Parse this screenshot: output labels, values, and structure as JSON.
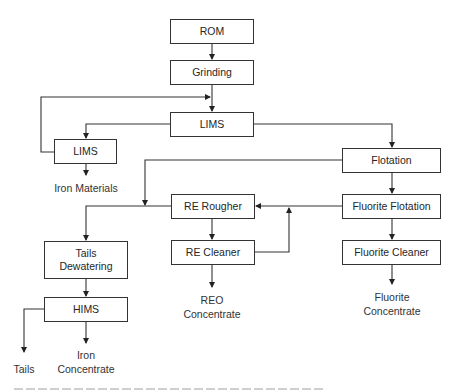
{
  "diagram": {
    "type": "process-flowsheet",
    "nodes": {
      "rom": "ROM",
      "grinding": "Grinding",
      "lims_main": "LIMS",
      "lims_secondary": "LIMS",
      "flotation": "Flotation",
      "re_rougher": "RE Rougher",
      "fluorite_flotation": "Fluorite Flotation",
      "re_cleaner": "RE Cleaner",
      "fluorite_cleaner": "Fluorite Cleaner",
      "tails_dewatering_1": "Tails",
      "tails_dewatering_2": "Dewatering",
      "hims": "HIMS"
    },
    "products": {
      "iron_materials": "Iron Materials",
      "reo_1": "REO",
      "reo_2": "Concentrate",
      "fluorite_1": "Fluorite",
      "fluorite_2": "Concentrate",
      "tails": "Tails",
      "iron_1": "Iron",
      "iron_2": "Concentrate"
    },
    "edges": [
      [
        "ROM",
        "Grinding"
      ],
      [
        "Grinding",
        "LIMS"
      ],
      [
        "LIMS",
        "LIMS (secondary)"
      ],
      [
        "LIMS",
        "Flotation"
      ],
      [
        "LIMS (secondary)",
        "Grinding/LIMS feed (recycle)"
      ],
      [
        "LIMS (secondary)",
        "Iron Materials"
      ],
      [
        "Flotation",
        "Fluorite Flotation"
      ],
      [
        "Flotation",
        "Tails Dewatering"
      ],
      [
        "Fluorite Flotation",
        "RE Rougher"
      ],
      [
        "Fluorite Flotation",
        "Fluorite Cleaner"
      ],
      [
        "RE Rougher",
        "RE Cleaner"
      ],
      [
        "RE Rougher",
        "Tails Dewatering"
      ],
      [
        "RE Cleaner",
        "RE Rougher (recycle)"
      ],
      [
        "RE Cleaner",
        "REO Concentrate"
      ],
      [
        "Fluorite Cleaner",
        "Fluorite Concentrate"
      ],
      [
        "Tails Dewatering",
        "HIMS"
      ],
      [
        "HIMS",
        "Tails"
      ],
      [
        "HIMS",
        "Iron Concentrate"
      ]
    ]
  },
  "colors": {
    "line": "#333333",
    "text": "#262626",
    "background": "#ffffff"
  }
}
